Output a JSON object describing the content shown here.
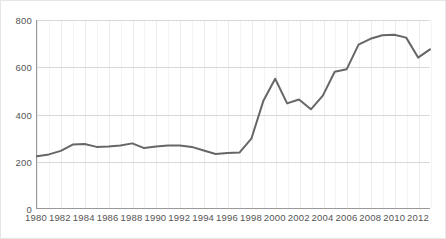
{
  "chart_data": {
    "type": "line",
    "title": "",
    "xlabel": "",
    "ylabel": "",
    "x": [
      1980,
      1981,
      1982,
      1983,
      1984,
      1985,
      1986,
      1987,
      1988,
      1989,
      1990,
      1991,
      1992,
      1993,
      1994,
      1995,
      1996,
      1997,
      1998,
      1999,
      2000,
      2001,
      2002,
      2003,
      2004,
      2005,
      2006,
      2007,
      2008,
      2009,
      2010,
      2011,
      2012,
      2013
    ],
    "values": [
      220,
      228,
      243,
      270,
      272,
      260,
      262,
      266,
      275,
      255,
      262,
      266,
      266,
      260,
      245,
      230,
      234,
      236,
      295,
      455,
      550,
      445,
      462,
      420,
      478,
      580,
      590,
      695,
      720,
      735,
      737,
      725,
      640,
      675
    ],
    "series": [
      {
        "name": "series-1",
        "color": "#666666",
        "values": [
          220,
          228,
          243,
          270,
          272,
          260,
          262,
          266,
          275,
          255,
          262,
          266,
          266,
          260,
          245,
          230,
          234,
          236,
          295,
          455,
          550,
          445,
          462,
          420,
          478,
          580,
          590,
          695,
          720,
          735,
          737,
          725,
          640,
          675
        ]
      }
    ],
    "xlim": [
      1980,
      2013
    ],
    "ylim": [
      0,
      800
    ],
    "yticks": [
      0,
      200,
      400,
      600,
      800
    ],
    "xticks": [
      1980,
      1982,
      1984,
      1986,
      1988,
      1990,
      1992,
      1994,
      1996,
      1998,
      2000,
      2002,
      2004,
      2006,
      2008,
      2010,
      2012
    ],
    "xtick_labels": [
      "1980",
      "1982",
      "1984",
      "1986",
      "1988",
      "1990",
      "1992",
      "1994",
      "1996",
      "1998",
      "2000",
      "2002",
      "2004",
      "2006",
      "2008",
      "2010",
      "2012"
    ],
    "ytick_labels": [
      "0",
      "200",
      "400",
      "600",
      "800"
    ],
    "grid": true,
    "legend": false,
    "legend_position": "none",
    "line_color": "#6b6b6b",
    "grid_color": "#d8d8d8",
    "axis_color": "#999999",
    "background": "#ffffff"
  }
}
